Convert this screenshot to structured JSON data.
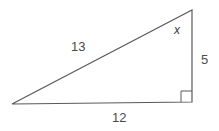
{
  "diagram": {
    "type": "right-triangle",
    "colors": {
      "stroke": "#5a5a5a",
      "label": "#4a4a4a",
      "background": "#ffffff"
    },
    "vertices": {
      "top": [
        192,
        10
      ],
      "right_angle": [
        192,
        102
      ],
      "left": [
        12,
        104
      ]
    },
    "labels": {
      "hypotenuse": "13",
      "base": "12",
      "height": "5",
      "angle": "x"
    }
  }
}
